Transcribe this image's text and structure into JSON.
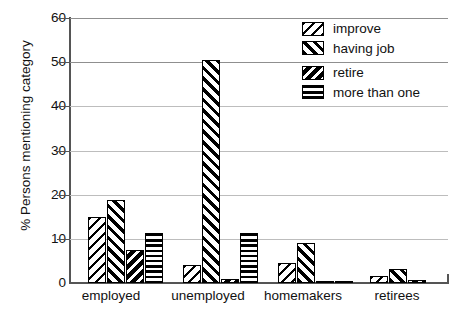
{
  "chart_data": {
    "type": "bar",
    "title": "",
    "subtitle": "",
    "xlabel": "",
    "ylabel": "% Persons mentioning category",
    "ylim": [
      0,
      60
    ],
    "yticks": [
      0,
      10,
      20,
      30,
      40,
      50,
      60
    ],
    "ytick_labels": [
      "0",
      "10",
      "20",
      "30",
      "40",
      "50",
      "60"
    ],
    "grid": true,
    "grid_axis": "y",
    "legend_position": "top-right",
    "categories": [
      "employed",
      "unemployed",
      "homemakers",
      "retirees"
    ],
    "series": [
      {
        "name": "improve",
        "pattern": "diagonal-backslash-hatch",
        "values": [
          15.0,
          4.0,
          4.6,
          1.6
        ]
      },
      {
        "name": "having job",
        "pattern": "diagonal-forwardslash-hatch",
        "values": [
          18.8,
          50.5,
          9.0,
          3.1
        ]
      },
      {
        "name": "retire",
        "pattern": "white-backslash-on-black-hatch",
        "values": [
          7.5,
          0.8,
          0.3,
          0.6
        ]
      },
      {
        "name": "more than one",
        "pattern": "horizontal-line-hatch",
        "values": [
          11.3,
          11.3,
          0.3,
          0.0
        ]
      }
    ]
  },
  "legend": {
    "items": [
      {
        "label": "improve"
      },
      {
        "label": "having job"
      },
      {
        "label": "retire"
      },
      {
        "label": "more than one"
      }
    ]
  },
  "axes": {
    "y_title": "% Persons mentioning category",
    "y_tick_labels": [
      "60",
      "50",
      "40",
      "30",
      "20",
      "10",
      "0"
    ],
    "x_tick_labels": [
      "employed",
      "unemployed",
      "homemakers",
      "retirees"
    ]
  },
  "colors": {
    "ink": "#000000",
    "axis": "#555555",
    "grid": "#bdbdbd",
    "background": "#ffffff"
  }
}
